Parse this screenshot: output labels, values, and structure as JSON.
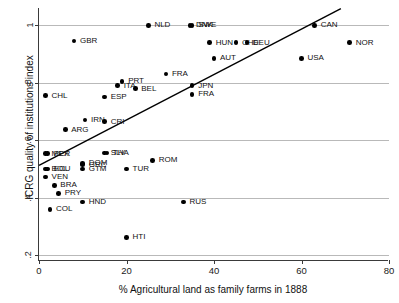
{
  "chart_data": {
    "type": "scatter",
    "title": "",
    "xlabel": "% Agricultural land as family farms in 1888",
    "ylabel": "ICRG quality of institutions index",
    "xlim": [
      0,
      80
    ],
    "ylim": [
      0.18,
      1.06
    ],
    "xticks": [
      0,
      20,
      40,
      60,
      80
    ],
    "xtick_labels": [
      "0",
      "20",
      "40",
      "60",
      "80"
    ],
    "yticks": [
      0.2,
      0.4,
      0.6,
      0.8,
      1.0
    ],
    "ytick_labels": [
      ".2",
      ".4",
      ".6",
      ".8",
      "1"
    ],
    "grid": "horizontal",
    "legend": "none",
    "points": [
      {
        "label": "NLD",
        "x": 25.0,
        "y": 1.0
      },
      {
        "label": "DNK",
        "x": 34.5,
        "y": 1.0
      },
      {
        "label": "SWE",
        "x": 35.0,
        "y": 1.0
      },
      {
        "label": "CAN",
        "x": 63.0,
        "y": 1.0
      },
      {
        "label": "GBR",
        "x": 8.0,
        "y": 0.945
      },
      {
        "label": "HUN",
        "x": 39.0,
        "y": 0.94
      },
      {
        "label": "CHE",
        "x": 45.0,
        "y": 0.94
      },
      {
        "label": "DEU",
        "x": 47.5,
        "y": 0.94
      },
      {
        "label": "NOR",
        "x": 71.0,
        "y": 0.94
      },
      {
        "label": "AUT",
        "x": 40.0,
        "y": 0.885
      },
      {
        "label": "USA",
        "x": 60.0,
        "y": 0.885
      },
      {
        "label": "FRA",
        "x": 29.0,
        "y": 0.83
      },
      {
        "label": "PRT",
        "x": 19.0,
        "y": 0.805
      },
      {
        "label": "ITA",
        "x": 18.0,
        "y": 0.79
      },
      {
        "label": "JPN",
        "x": 35.0,
        "y": 0.79
      },
      {
        "label": "BEL",
        "x": 22.0,
        "y": 0.78
      },
      {
        "label": "FRA",
        "x": 35.0,
        "y": 0.76
      },
      {
        "label": "CHL",
        "x": 1.5,
        "y": 0.755
      },
      {
        "label": "ESP",
        "x": 15.0,
        "y": 0.75
      },
      {
        "label": "IRN",
        "x": 10.5,
        "y": 0.67
      },
      {
        "label": "CRI",
        "x": 15.0,
        "y": 0.665
      },
      {
        "label": "ARG",
        "x": 6.0,
        "y": 0.637
      },
      {
        "label": "MEX",
        "x": 1.5,
        "y": 0.553
      },
      {
        "label": "PER",
        "x": 2.0,
        "y": 0.553
      },
      {
        "label": "SLV",
        "x": 15.0,
        "y": 0.555
      },
      {
        "label": "THA",
        "x": 15.5,
        "y": 0.555
      },
      {
        "label": "ROM",
        "x": 26.0,
        "y": 0.53
      },
      {
        "label": "DOM",
        "x": 10.0,
        "y": 0.52
      },
      {
        "label": "GRC",
        "x": 10.0,
        "y": 0.515
      },
      {
        "label": "BOL",
        "x": 1.5,
        "y": 0.5
      },
      {
        "label": "ECU",
        "x": 2.0,
        "y": 0.5
      },
      {
        "label": "GTM",
        "x": 10.0,
        "y": 0.5
      },
      {
        "label": "TUR",
        "x": 20.0,
        "y": 0.5
      },
      {
        "label": "VEN",
        "x": 1.5,
        "y": 0.472
      },
      {
        "label": "BRA",
        "x": 3.5,
        "y": 0.443
      },
      {
        "label": "PRY",
        "x": 4.5,
        "y": 0.415
      },
      {
        "label": "HND",
        "x": 10.0,
        "y": 0.385
      },
      {
        "label": "RUS",
        "x": 33.0,
        "y": 0.385
      },
      {
        "label": "COL",
        "x": 2.5,
        "y": 0.36
      },
      {
        "label": "HTI",
        "x": 20.0,
        "y": 0.262
      }
    ],
    "fit_line": {
      "x0": 0.0,
      "y0": 0.513,
      "x1": 69.0,
      "y1": 1.058
    }
  }
}
